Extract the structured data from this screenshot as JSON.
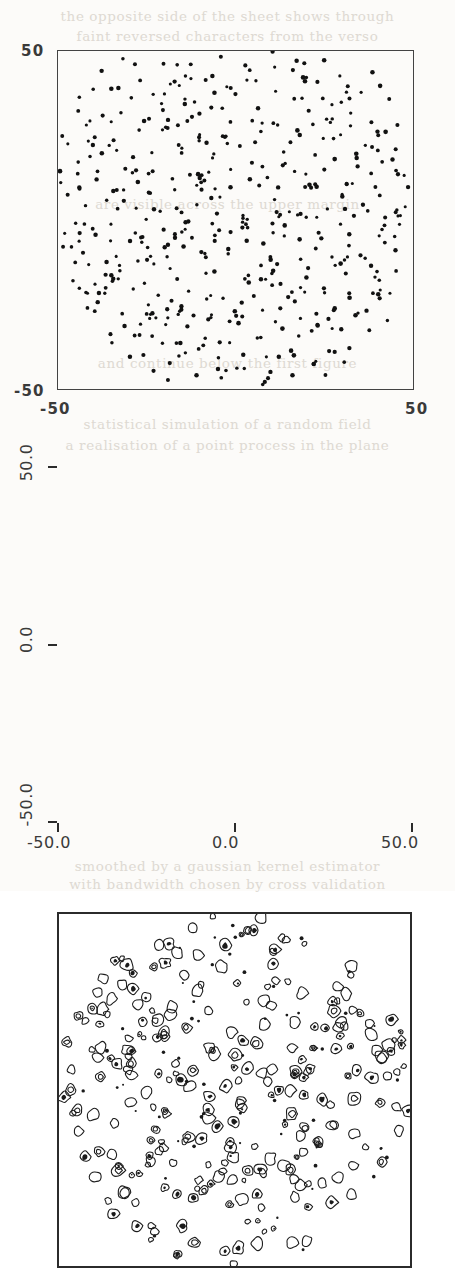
{
  "page": {
    "kind": "scanned-journal-page",
    "width": 455,
    "height": 891,
    "ink_color": "#2b2b2b",
    "paper_color": "#fcfbf9",
    "bleed_color": "#d9d4cc"
  },
  "bleedthrough_lines": [
    {
      "text": "the opposite side of the sheet shows through",
      "top": 8
    },
    {
      "text": "faint reversed characters from the verso",
      "top": 28
    },
    {
      "text": "are visible across the upper margin",
      "top": 196
    },
    {
      "text": "and continue below the first figure",
      "top": 355
    },
    {
      "text": "statistical simulation of a random field",
      "top": 416
    },
    {
      "text": "a realisation of a point process in the plane",
      "top": 437
    },
    {
      "text": "smoothed by a gaussian kernel estimator",
      "top": 858
    },
    {
      "text": "with bandwidth chosen by cross validation",
      "top": 876
    }
  ],
  "figures": [
    {
      "id": "scatter",
      "name": "scatter-plot",
      "axis": {
        "x": {
          "ticks": [
            {
              "label": "-50",
              "value": -50
            },
            {
              "label": "50",
              "value": 50
            }
          ],
          "min": -50,
          "max": 50
        },
        "y": {
          "ticks": [
            {
              "label": "-50",
              "value": -50
            },
            {
              "label": "50",
              "value": 50
            }
          ],
          "min": -50,
          "max": 50
        }
      }
    },
    {
      "id": "contour",
      "name": "contour-plot",
      "axis": {
        "x": {
          "ticks": [
            {
              "label": "-50.0",
              "value": -50
            },
            {
              "label": "0.0",
              "value": 0
            },
            {
              "label": "50.0",
              "value": 50
            }
          ],
          "min": -50,
          "max": 50
        },
        "y": {
          "ticks": [
            {
              "label": "50.0",
              "value": 50
            },
            {
              "label": "0.0",
              "value": 0
            },
            {
              "label": "-50.0",
              "value": -50
            }
          ],
          "min": -50,
          "max": 50
        }
      }
    }
  ],
  "labels": {
    "scatter_y_top": "50",
    "scatter_y_bottom": "-50",
    "scatter_x_left": "-50",
    "scatter_x_right": "50",
    "contour_y_top": "50.0",
    "contour_y_mid": "0.0",
    "contour_y_bottom": "-50.0",
    "contour_x_left": "-50.0",
    "contour_x_mid": "0.0",
    "contour_x_right": "50.0"
  },
  "chart_data": [
    {
      "type": "scatter",
      "title": "",
      "xlabel": "",
      "ylabel": "",
      "xlim": [
        -50,
        50
      ],
      "ylim": [
        -50,
        50
      ],
      "xticks": [
        -50,
        50
      ],
      "yticks": [
        -50,
        50
      ],
      "xticklabels": [
        "-50",
        "50"
      ],
      "yticklabels": [
        "-50",
        "50"
      ],
      "grid": false,
      "legend": null,
      "marker": {
        "shape": "filled-circle",
        "size_px": 3,
        "color": "#111111"
      },
      "n_points": 430,
      "distribution": "uniform points filling a disc of radius ~50 inscribed in the square, with thinning toward the square corners",
      "points": [
        [
          -33,
          47
        ],
        [
          -18,
          46
        ],
        [
          -5,
          49
        ],
        [
          9,
          49
        ],
        [
          18,
          48
        ],
        [
          24,
          47
        ],
        [
          -38,
          43
        ],
        [
          -29,
          44
        ],
        [
          -22,
          45
        ],
        [
          -13,
          43
        ],
        [
          2,
          45
        ],
        [
          11,
          44
        ],
        [
          21,
          43
        ],
        [
          31,
          43
        ],
        [
          38,
          44
        ],
        [
          -42,
          40
        ],
        [
          -35,
          41
        ],
        [
          -26,
          40
        ],
        [
          -16,
          41
        ],
        [
          -8,
          40
        ],
        [
          4,
          41
        ],
        [
          13,
          40
        ],
        [
          23,
          41
        ],
        [
          33,
          40
        ],
        [
          40,
          39
        ],
        [
          -44,
          36
        ],
        [
          -37,
          37
        ],
        [
          -31,
          35
        ],
        [
          -24,
          36
        ],
        [
          -14,
          37
        ],
        [
          -4,
          36
        ],
        [
          7,
          35
        ],
        [
          16,
          36
        ],
        [
          26,
          35
        ],
        [
          35,
          36
        ],
        [
          43,
          34
        ],
        [
          -46,
          32
        ],
        [
          -40,
          31
        ],
        [
          -33,
          32
        ],
        [
          -27,
          30
        ],
        [
          -19,
          31
        ],
        [
          -10,
          32
        ],
        [
          0,
          31
        ],
        [
          9,
          30
        ],
        [
          19,
          31
        ],
        [
          28,
          30
        ],
        [
          37,
          31
        ],
        [
          44,
          29
        ],
        [
          -47,
          26
        ],
        [
          -41,
          27
        ],
        [
          -34,
          25
        ],
        [
          -28,
          26
        ],
        [
          -21,
          27
        ],
        [
          -12,
          25
        ],
        [
          -2,
          26
        ],
        [
          6,
          27
        ],
        [
          15,
          25
        ],
        [
          25,
          26
        ],
        [
          34,
          27
        ],
        [
          42,
          25
        ],
        [
          -48,
          21
        ],
        [
          -43,
          20
        ],
        [
          -36,
          21
        ],
        [
          -30,
          19
        ],
        [
          -23,
          20
        ],
        [
          -15,
          21
        ],
        [
          -6,
          20
        ],
        [
          3,
          19
        ],
        [
          12,
          20
        ],
        [
          21,
          21
        ],
        [
          30,
          20
        ],
        [
          39,
          21
        ],
        [
          46,
          19
        ],
        [
          -49,
          15
        ],
        [
          -44,
          16
        ],
        [
          -38,
          14
        ],
        [
          -31,
          15
        ],
        [
          -25,
          16
        ],
        [
          -17,
          14
        ],
        [
          -9,
          15
        ],
        [
          -1,
          16
        ],
        [
          8,
          14
        ],
        [
          17,
          15
        ],
        [
          27,
          16
        ],
        [
          36,
          14
        ],
        [
          44,
          15
        ],
        [
          -49,
          10
        ],
        [
          -45,
          9
        ],
        [
          -39,
          10
        ],
        [
          -33,
          8
        ],
        [
          -26,
          9
        ],
        [
          -19,
          10
        ],
        [
          -11,
          8
        ],
        [
          -3,
          9
        ],
        [
          5,
          10
        ],
        [
          14,
          8
        ],
        [
          24,
          9
        ],
        [
          33,
          10
        ],
        [
          41,
          8
        ],
        [
          47,
          9
        ],
        [
          -49,
          4
        ],
        [
          -44,
          3
        ],
        [
          -37,
          4
        ],
        [
          -30,
          2
        ],
        [
          -24,
          3
        ],
        [
          -16,
          4
        ],
        [
          -7,
          2
        ],
        [
          1,
          3
        ],
        [
          10,
          4
        ],
        [
          20,
          2
        ],
        [
          29,
          3
        ],
        [
          38,
          4
        ],
        [
          45,
          2
        ],
        [
          -48,
          -2
        ],
        [
          -43,
          -3
        ],
        [
          -36,
          -1
        ],
        [
          -29,
          -2
        ],
        [
          -22,
          -3
        ],
        [
          -14,
          -1
        ],
        [
          -5,
          -2
        ],
        [
          4,
          -3
        ],
        [
          13,
          -1
        ],
        [
          22,
          -2
        ],
        [
          31,
          -3
        ],
        [
          40,
          -1
        ],
        [
          46,
          -2
        ],
        [
          -47,
          -7
        ],
        [
          -42,
          -8
        ],
        [
          -35,
          -6
        ],
        [
          -28,
          -7
        ],
        [
          -20,
          -8
        ],
        [
          -12,
          -6
        ],
        [
          -4,
          -7
        ],
        [
          6,
          -8
        ],
        [
          15,
          -6
        ],
        [
          25,
          -7
        ],
        [
          34,
          -8
        ],
        [
          42,
          -6
        ],
        [
          -46,
          -12
        ],
        [
          -40,
          -13
        ],
        [
          -33,
          -11
        ],
        [
          -26,
          -12
        ],
        [
          -18,
          -13
        ],
        [
          -10,
          -11
        ],
        [
          -1,
          -12
        ],
        [
          8,
          -13
        ],
        [
          18,
          -11
        ],
        [
          27,
          -12
        ],
        [
          36,
          -13
        ],
        [
          44,
          -11
        ],
        [
          -44,
          -17
        ],
        [
          -38,
          -18
        ],
        [
          -31,
          -16
        ],
        [
          -24,
          -17
        ],
        [
          -16,
          -18
        ],
        [
          -8,
          -16
        ],
        [
          2,
          -17
        ],
        [
          11,
          -18
        ],
        [
          20,
          -16
        ],
        [
          30,
          -17
        ],
        [
          39,
          -18
        ],
        [
          45,
          -16
        ],
        [
          -42,
          -22
        ],
        [
          -36,
          -23
        ],
        [
          -29,
          -21
        ],
        [
          -21,
          -22
        ],
        [
          -13,
          -23
        ],
        [
          -5,
          -21
        ],
        [
          5,
          -22
        ],
        [
          14,
          -23
        ],
        [
          23,
          -21
        ],
        [
          32,
          -22
        ],
        [
          41,
          -23
        ],
        [
          -40,
          -27
        ],
        [
          -33,
          -28
        ],
        [
          -26,
          -26
        ],
        [
          -18,
          -27
        ],
        [
          -10,
          -28
        ],
        [
          -2,
          -26
        ],
        [
          8,
          -27
        ],
        [
          17,
          -28
        ],
        [
          26,
          -26
        ],
        [
          35,
          -27
        ],
        [
          42,
          -28
        ],
        [
          -37,
          -32
        ],
        [
          -30,
          -33
        ],
        [
          -23,
          -31
        ],
        [
          -15,
          -32
        ],
        [
          -7,
          -33
        ],
        [
          2,
          -31
        ],
        [
          11,
          -32
        ],
        [
          21,
          -33
        ],
        [
          30,
          -31
        ],
        [
          38,
          -32
        ],
        [
          -33,
          -37
        ],
        [
          -26,
          -38
        ],
        [
          -19,
          -36
        ],
        [
          -11,
          -37
        ],
        [
          -3,
          -38
        ],
        [
          6,
          -36
        ],
        [
          16,
          -37
        ],
        [
          25,
          -38
        ],
        [
          34,
          -36
        ],
        [
          -28,
          -42
        ],
        [
          -21,
          -43
        ],
        [
          -13,
          -41
        ],
        [
          -5,
          -42
        ],
        [
          4,
          -43
        ],
        [
          13,
          -41
        ],
        [
          23,
          -42
        ],
        [
          31,
          -43
        ],
        [
          -20,
          -46
        ],
        [
          -12,
          -47
        ],
        [
          -3,
          -46
        ],
        [
          7,
          -47
        ],
        [
          16,
          -46
        ],
        [
          25,
          -45
        ]
      ]
    },
    {
      "type": "contour",
      "title": "",
      "xlabel": "",
      "ylabel": "",
      "xlim": [
        -50,
        50
      ],
      "ylim": [
        -50,
        50
      ],
      "xticks": [
        -50,
        0,
        50
      ],
      "yticks": [
        -50,
        0,
        50
      ],
      "xticklabels": [
        "-50.0",
        "0.0",
        "50.0"
      ],
      "yticklabels": [
        "-50.0",
        "0.0",
        "50.0"
      ],
      "grid": false,
      "legend": null,
      "description": "density contours of the point pattern above: many small closed rings, some with a filled dark core, covering the same disc-shaped support",
      "n_blobs": 330,
      "contour_style": {
        "stroke": "#1c1c1c",
        "stroke_width_px": 1.1,
        "fill_core": "#1a1a1a"
      }
    }
  ]
}
